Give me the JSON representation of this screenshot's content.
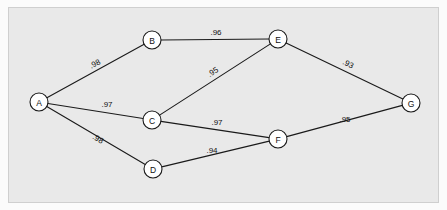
{
  "figure": {
    "type": "undirected-weighted-graph",
    "panel_background": "#e9e9e9",
    "panel_border": "#cfcfcf",
    "node_fill": "#ffffff",
    "stroke_color": "#1a1a1a",
    "node_radius": 9
  },
  "chart_data": {
    "type": "diagram",
    "title": "",
    "xlabel": "",
    "ylabel": "",
    "grid": false,
    "legend": "none",
    "nodes": [
      {
        "id": "A",
        "label": "A",
        "x": 39,
        "y": 102
      },
      {
        "id": "B",
        "label": "B",
        "x": 152,
        "y": 40
      },
      {
        "id": "C",
        "label": "C",
        "x": 152,
        "y": 120
      },
      {
        "id": "D",
        "label": "D",
        "x": 153,
        "y": 169
      },
      {
        "id": "E",
        "label": "E",
        "x": 278,
        "y": 39
      },
      {
        "id": "F",
        "label": "F",
        "x": 278,
        "y": 139
      },
      {
        "id": "G",
        "label": "G",
        "x": 411,
        "y": 103
      }
    ],
    "edges": [
      {
        "source": "A",
        "target": "B",
        "weight": ".98",
        "value": 0.98,
        "label_x": 95,
        "label_y": 64,
        "rotate": -28.7
      },
      {
        "source": "A",
        "target": "C",
        "weight": ".97",
        "value": 0.97,
        "label_x": 107,
        "label_y": 104,
        "rotate": 0
      },
      {
        "source": "A",
        "target": "D",
        "weight": ".98",
        "value": 0.98,
        "label_x": 98,
        "label_y": 139,
        "rotate": 30.4
      },
      {
        "source": "B",
        "target": "E",
        "weight": ".96",
        "value": 0.96,
        "label_x": 216,
        "label_y": 32,
        "rotate": 0
      },
      {
        "source": "C",
        "target": "E",
        "weight": ".95",
        "value": 0.95,
        "label_x": 213,
        "label_y": 72,
        "rotate": -33.0
      },
      {
        "source": "C",
        "target": "F",
        "weight": ".97",
        "value": 0.97,
        "label_x": 217,
        "label_y": 122,
        "rotate": 0
      },
      {
        "source": "D",
        "target": "F",
        "weight": ".94",
        "value": 0.94,
        "label_x": 212,
        "label_y": 150,
        "rotate": 0
      },
      {
        "source": "E",
        "target": "G",
        "weight": ".93",
        "value": 0.93,
        "label_x": 348,
        "label_y": 64,
        "rotate": 26.3
      },
      {
        "source": "F",
        "target": "G",
        "weight": ".95",
        "value": 0.95,
        "label_x": 345,
        "label_y": 119,
        "rotate": 0
      }
    ]
  }
}
